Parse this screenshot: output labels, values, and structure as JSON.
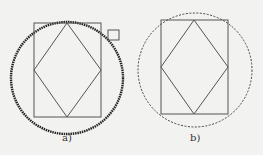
{
  "figures": [
    {
      "label": "a)",
      "circle_style": "thick-dotted",
      "has_marker_square": true
    },
    {
      "label": "b)",
      "circle_style": "dashed",
      "has_marker_square": false
    }
  ],
  "colors": {
    "line": "#555555",
    "circle_a": "#222222",
    "circle_b": "#444444",
    "background": "#f2f2f0"
  }
}
